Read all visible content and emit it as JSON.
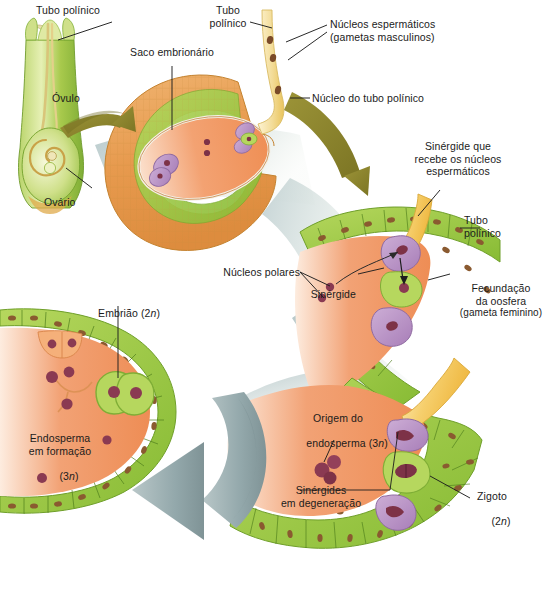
{
  "figure": {
    "language": "pt-BR",
    "background": "#ffffff"
  },
  "palette": {
    "integument_orange": "#e79a4e",
    "embryo_sac_orange": "#f0935e",
    "cell_green": "#a8d04a",
    "green_pale": "#cfe48d",
    "pollen_tube_yellow": "#f2d98a",
    "pollen_tube_deep": "#f0bf4a",
    "synergid_purple": "#b38ec0",
    "nucleus_maroon": "#8c3a52",
    "arrow_olive": "#8d8532",
    "arrow_grey": "#8fa3a6",
    "band_grey": "#9fb3b6",
    "label_text": "#1b1b1b",
    "flower_green": "#8cc63f"
  },
  "panels": [
    {
      "id": "flower",
      "name": "Flor com ovario e ovulo"
    },
    {
      "id": "ovule",
      "name": "Ovulo com saco embrionario"
    },
    {
      "id": "fertilization",
      "name": "Fecundacao no saco embrionario"
    },
    {
      "id": "zygote",
      "name": "Zigoto e origem do endosperma"
    },
    {
      "id": "embryo",
      "name": "Embriao e endosperma em formacao"
    }
  ],
  "labels": {
    "tubo_polinico_flor": "Tubo polínico",
    "ovulo": "Óvulo",
    "ovario": "Ovário",
    "saco_embrionario": "Saco embrionário",
    "tubo_polinico_topo_l1": "Tubo",
    "tubo_polinico_topo_l2": "polínico",
    "nucleos_esp_l1": "Núcleos espermáticos",
    "nucleos_esp_l2": "(gametas masculinos)",
    "nucleo_tubo": "Núcleo do tubo polínico",
    "sinergide_recebe_l1": "Sinérgide que",
    "sinergide_recebe_l2": "recebe os núcleos",
    "sinergide_recebe_l3": "espermáticos",
    "tubo_polinico_meio_l1": "Tubo",
    "tubo_polinico_meio_l2": "polínico",
    "nucleos_polares": "Núcleos polares",
    "sinergide": "Sinérgide",
    "fecundacao_l1": "Fecundação",
    "fecundacao_l2": "da oosfera",
    "fecundacao_l3": "(gameta feminino)",
    "embriao": "Embrião (2",
    "embriao_n": "n",
    "embriao_end": ")",
    "endosperma_l1": "Endosperma",
    "endosperma_l2": "em formação",
    "endosperma_l3a": "(3",
    "endosperma_l3n": "n",
    "endosperma_l3b": ")",
    "origem_end_l1": "Origem do",
    "origem_end_l2a": "endosperma (3",
    "origem_end_l2n": "n",
    "origem_end_l2b": ")",
    "sinergides_deg_l1": "Sinérgides",
    "sinergides_deg_l2": "em degeneração",
    "zigoto_l1": "Zigoto",
    "zigoto_l2a": "(2",
    "zigoto_l2n": "n",
    "zigoto_l2b": ")"
  }
}
